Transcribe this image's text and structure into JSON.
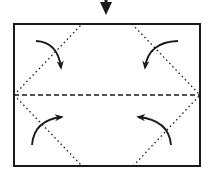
{
  "diagram": {
    "type": "origami-fold-step",
    "colors": {
      "ink": "#1a1a1a",
      "background": "#ffffff"
    },
    "step_arrow": {
      "direction": "down",
      "x": 106,
      "y_start": 0,
      "y_end": 15
    },
    "paper": {
      "x": 14,
      "y": 24,
      "width": 186,
      "height": 142
    },
    "valley_fold_line": {
      "x1": 14,
      "y1": 95,
      "x2": 200,
      "y2": 95,
      "style": "dashed"
    },
    "corner_fold_lines": [
      {
        "name": "top-left",
        "x1": 14,
        "y1": 95,
        "x2": 82,
        "y2": 24,
        "style": "dotted"
      },
      {
        "name": "top-right",
        "x1": 132,
        "y1": 24,
        "x2": 200,
        "y2": 95,
        "style": "dotted"
      },
      {
        "name": "bottom-left",
        "x1": 14,
        "y1": 95,
        "x2": 82,
        "y2": 166,
        "style": "dotted"
      },
      {
        "name": "bottom-right",
        "x1": 133,
        "y1": 166,
        "x2": 200,
        "y2": 95,
        "style": "dotted"
      }
    ],
    "fold_arrows": [
      {
        "name": "top-left",
        "direction": "fold corner inward"
      },
      {
        "name": "top-right",
        "direction": "fold corner inward"
      },
      {
        "name": "bottom-left",
        "direction": "fold corner inward"
      },
      {
        "name": "bottom-right",
        "direction": "fold corner inward"
      }
    ]
  }
}
